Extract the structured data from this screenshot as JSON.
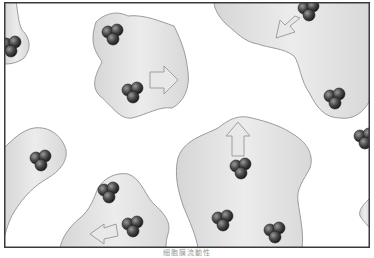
{
  "figure": {
    "caption": "細胞膜流動性",
    "colors": {
      "background": "#ffffff",
      "frame": "#3a3a3a",
      "region_fill": "#e2e2e2",
      "region_stroke": "#9b9b9b",
      "molecule": "#4a4a4a",
      "arrow_fill": "#e8e8e8",
      "arrow_stroke": "#9e9e9e"
    },
    "regions": [
      {
        "id": "top-left-edge",
        "molecule_clusters": 1,
        "arrow": null
      },
      {
        "id": "top-center",
        "molecule_clusters": 2,
        "arrow": "right"
      },
      {
        "id": "top-right",
        "molecule_clusters": 2,
        "arrow": "down-left"
      },
      {
        "id": "mid-left",
        "molecule_clusters": 1,
        "arrow": null
      },
      {
        "id": "bottom-left",
        "molecule_clusters": 2,
        "arrow": "left"
      },
      {
        "id": "bottom-center",
        "molecule_clusters": 3,
        "arrow": "up"
      },
      {
        "id": "right-edge",
        "molecule_clusters": 1,
        "arrow": null
      }
    ]
  }
}
